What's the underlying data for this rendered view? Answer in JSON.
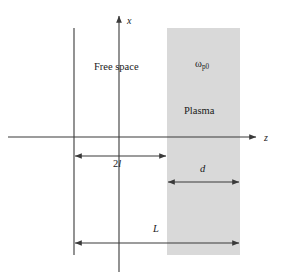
{
  "figure": {
    "background_color": "#ffffff",
    "line_color": "#3a3a3a",
    "plasma_fill_color": "#d9d9d9",
    "text_color": "#1a1a1a",
    "width": 285,
    "height": 277
  },
  "axes": {
    "vertical": {
      "label": "x",
      "position_x": 119,
      "top_y": 14,
      "bottom_y": 272,
      "arrow": "up"
    },
    "horizontal": {
      "label": "z",
      "position_y": 137,
      "left_x": 8,
      "right_x": 258,
      "arrow": "right"
    }
  },
  "regions": [
    {
      "name": "free-space",
      "label": "Free space",
      "x": 122,
      "y": 67
    },
    {
      "name": "plasma",
      "label": "Plasma",
      "x": 203,
      "y": 111,
      "left_x": 167,
      "right_x": 240,
      "top_y": 28,
      "bottom_y": 255
    }
  ],
  "annotations": [
    {
      "name": "plasma-frequency",
      "symbol": "ω",
      "subscript": "p0",
      "x": 205,
      "y": 65
    }
  ],
  "dimensions": [
    {
      "name": "two-l",
      "label_prefix": "2",
      "label_symbol": "l",
      "label": "2l",
      "from_x": 74,
      "to_x": 167,
      "y": 156,
      "label_x": 120,
      "label_y": 164,
      "arrow": "both"
    },
    {
      "name": "d",
      "label": "d",
      "from_x": 167,
      "to_x": 240,
      "y": 182,
      "label_x": 203,
      "label_y": 170,
      "arrow": "both"
    },
    {
      "name": "L",
      "label": "L",
      "from_x": 74,
      "to_x": 240,
      "y": 243,
      "label_x": 156,
      "label_y": 230,
      "arrow": "both"
    }
  ],
  "boundaries": [
    {
      "name": "left-boundary",
      "x": 74,
      "top_y": 28,
      "bottom_y": 255
    }
  ]
}
